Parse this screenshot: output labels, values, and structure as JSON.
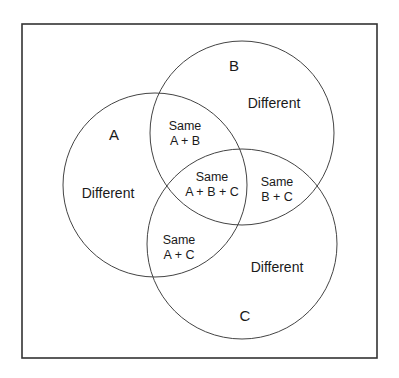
{
  "diagram": {
    "type": "venn",
    "frame": {
      "x": 22,
      "y": 24,
      "width": 355,
      "height": 334,
      "stroke": "#333333"
    },
    "circles": [
      {
        "id": "A",
        "label": "A",
        "cx": 155,
        "cy": 185,
        "r": 92,
        "stroke": "#444444"
      },
      {
        "id": "B",
        "label": "B",
        "cx": 242,
        "cy": 133,
        "r": 92,
        "stroke": "#444444"
      },
      {
        "id": "C",
        "label": "C",
        "cx": 242,
        "cy": 244,
        "r": 95,
        "stroke": "#444444"
      }
    ],
    "set_labels": {
      "a": "A",
      "b": "B",
      "c": "C"
    },
    "regions": {
      "a_only": "Different",
      "b_only": "Different",
      "c_only": "Different",
      "ab": {
        "line1": "Same",
        "line2": "A + B"
      },
      "ac": {
        "line1": "Same",
        "line2": "A + C"
      },
      "bc": {
        "line1": "Same",
        "line2": "B + C"
      },
      "abc": {
        "line1": "Same",
        "line2": "A + B + C"
      }
    }
  }
}
